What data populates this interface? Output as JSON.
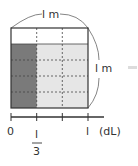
{
  "diagram": {
    "top_dimension": "l m",
    "side_dimension": "l m",
    "number_line": {
      "ticks": [
        "0",
        "1/3",
        "",
        "1"
      ],
      "unit": "(dL)",
      "fraction": {
        "numerator": "l",
        "denominator": "3"
      },
      "end_label": "l"
    },
    "grid": {
      "columns": 3,
      "rows": 4,
      "shaded_columns": 1,
      "filled_rows_from_bottom": 4
    },
    "colors": {
      "dark_fill": "#7a7a7a",
      "light_fill": "#e6e6e6",
      "border": "#333333",
      "side_bar": "#dcdcdc"
    }
  }
}
